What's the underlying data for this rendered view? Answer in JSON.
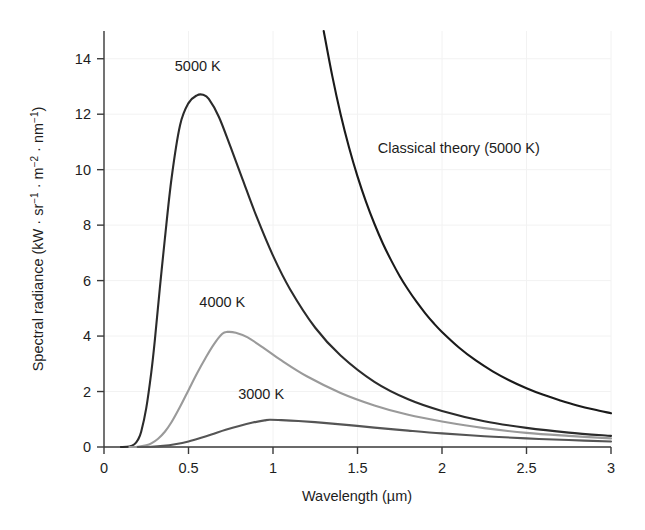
{
  "chart_data": {
    "type": "line",
    "title": "",
    "xlabel": "Wavelength (µm)",
    "ylabel": "Spectral radiance (kW · sr⁻¹ · m⁻² · nm⁻¹)",
    "xlim": [
      0,
      3
    ],
    "ylim": [
      0,
      15
    ],
    "xticks": [
      0,
      0.5,
      1,
      1.5,
      2,
      2.5,
      3
    ],
    "xticklabels": [
      "0",
      "0.5",
      "1",
      "1.5",
      "2",
      "2.5",
      "3"
    ],
    "yticks": [
      0,
      2,
      4,
      6,
      8,
      10,
      12,
      14
    ],
    "yticklabels": [
      "0",
      "2",
      "4",
      "6",
      "8",
      "10",
      "12",
      "14"
    ],
    "grid": true,
    "legend_position": "inline-annotations",
    "series": [
      {
        "name": "Classical theory (5000 K)",
        "color": "#1a1a1a",
        "label_text": "Classical theory (5000 K)",
        "label_x": 1.62,
        "label_y": 10.6,
        "peak": null,
        "x": [
          1.3,
          1.35,
          1.4,
          1.45,
          1.5,
          1.55,
          1.6,
          1.65,
          1.7,
          1.75,
          1.8,
          1.85,
          1.9,
          1.95,
          2.0,
          2.1,
          2.2,
          2.3,
          2.4,
          2.5,
          2.6,
          2.7,
          2.8,
          2.9,
          3.0
        ],
        "values": [
          15.0,
          13.4,
          12.0,
          10.8,
          9.76,
          8.85,
          8.05,
          7.34,
          6.72,
          6.16,
          5.67,
          5.23,
          4.83,
          4.47,
          4.15,
          3.59,
          3.12,
          2.73,
          2.4,
          2.12,
          1.88,
          1.68,
          1.5,
          1.35,
          1.22
        ]
      },
      {
        "name": "5000 K",
        "color": "#2b2b2b",
        "label_text": "5000 K",
        "label_x": 0.555,
        "label_y": 13.55,
        "peak": {
          "x": 0.586,
          "y": 12.7
        },
        "x": [
          0.1,
          0.15,
          0.18,
          0.2,
          0.22,
          0.25,
          0.28,
          0.3,
          0.33,
          0.36,
          0.4,
          0.45,
          0.5,
          0.55,
          0.586,
          0.62,
          0.68,
          0.75,
          0.82,
          0.9,
          1.0,
          1.1,
          1.25,
          1.4,
          1.6,
          1.8,
          2.0,
          2.25,
          2.5,
          2.75,
          3.0
        ],
        "values": [
          0.0,
          0.02,
          0.1,
          0.25,
          0.55,
          1.4,
          2.7,
          3.8,
          5.7,
          7.5,
          9.7,
          11.6,
          12.4,
          12.68,
          12.7,
          12.55,
          11.9,
          10.8,
          9.65,
          8.35,
          6.9,
          5.7,
          4.3,
          3.3,
          2.35,
          1.72,
          1.3,
          0.93,
          0.69,
          0.52,
          0.4
        ]
      },
      {
        "name": "4000 K",
        "color": "#9a9a9a",
        "label_text": "4000 K",
        "label_x": 0.7,
        "label_y": 5.05,
        "peak": {
          "x": 0.73,
          "y": 4.15
        },
        "x": [
          0.15,
          0.2,
          0.25,
          0.28,
          0.32,
          0.36,
          0.4,
          0.45,
          0.5,
          0.55,
          0.6,
          0.65,
          0.7,
          0.73,
          0.78,
          0.85,
          0.95,
          1.05,
          1.2,
          1.4,
          1.6,
          1.8,
          2.0,
          2.25,
          2.5,
          2.75,
          3.0
        ],
        "values": [
          0.0,
          0.01,
          0.06,
          0.13,
          0.3,
          0.55,
          0.9,
          1.45,
          2.05,
          2.65,
          3.2,
          3.7,
          4.08,
          4.15,
          4.12,
          3.95,
          3.55,
          3.12,
          2.55,
          1.95,
          1.5,
          1.16,
          0.92,
          0.68,
          0.51,
          0.4,
          0.31
        ]
      },
      {
        "name": "3000 K",
        "color": "#555555",
        "label_text": "3000 K",
        "label_x": 0.93,
        "label_y": 1.72,
        "peak": {
          "x": 0.98,
          "y": 0.98
        },
        "x": [
          0.2,
          0.28,
          0.35,
          0.42,
          0.5,
          0.58,
          0.65,
          0.72,
          0.8,
          0.88,
          0.95,
          0.98,
          1.05,
          1.15,
          1.3,
          1.45,
          1.6,
          1.8,
          2.0,
          2.25,
          2.5,
          2.75,
          3.0
        ],
        "values": [
          0.0,
          0.01,
          0.04,
          0.1,
          0.2,
          0.34,
          0.48,
          0.62,
          0.76,
          0.88,
          0.96,
          0.98,
          0.97,
          0.94,
          0.87,
          0.79,
          0.7,
          0.59,
          0.49,
          0.39,
          0.31,
          0.25,
          0.2
        ]
      }
    ]
  },
  "axes": {
    "x_title": "Wavelength (µm)",
    "y_title_main": "Spectral radiance (kW · sr",
    "y_title_exp1": "−1",
    "y_title_mid": " · m",
    "y_title_exp2": "−2",
    "y_title_mid2": " · nm",
    "y_title_exp3": "−1",
    "y_title_end": ")"
  },
  "colors": {
    "background": "#ffffff",
    "axis": "#3a3a3a",
    "grid": "#f2f2f2",
    "text": "#1d1d1d"
  }
}
